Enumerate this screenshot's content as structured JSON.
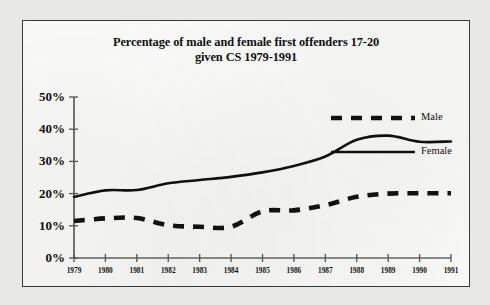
{
  "chart_data": {
    "type": "line",
    "title": "Percentage of male and female first offenders  17-20 given CS 1979-1991",
    "title_lines": [
      "Percentage of male and female first offenders  17-20",
      "given CS 1979-1991"
    ],
    "xlabel": "",
    "ylabel": "",
    "grid": false,
    "legend_position": "top-right",
    "ylim": [
      0,
      50
    ],
    "yticks": [
      0,
      10,
      20,
      30,
      40,
      50
    ],
    "ytick_labels": [
      "0%",
      "10%",
      "20%",
      "30%",
      "40%",
      "50%"
    ],
    "categories": [
      1979,
      1980,
      1981,
      1982,
      1983,
      1984,
      1985,
      1986,
      1987,
      1988,
      1989,
      1990,
      1991
    ],
    "xtick_labels": [
      "1979",
      "1980",
      "1981",
      "1982",
      "1983",
      "1984",
      "1985",
      "1986",
      "1987",
      "1988",
      "1989",
      "1990",
      "1991"
    ],
    "series": [
      {
        "name": "Male",
        "style": "dashed",
        "color": "#111111",
        "values": [
          11.5,
          12.3,
          12.4,
          10.2,
          9.7,
          9.7,
          14.5,
          14.8,
          16.4,
          19.0,
          20.0,
          20.1,
          20.1
        ]
      },
      {
        "name": "Female",
        "style": "solid",
        "color": "#111111",
        "values": [
          19.0,
          21.0,
          21.1,
          23.2,
          24.2,
          25.2,
          26.6,
          28.6,
          31.5,
          36.7,
          38.0,
          36.1,
          36.2
        ]
      }
    ]
  },
  "legend": {
    "items": [
      {
        "label": "Male",
        "style": "dashed"
      },
      {
        "label": "Female",
        "style": "solid"
      }
    ]
  }
}
